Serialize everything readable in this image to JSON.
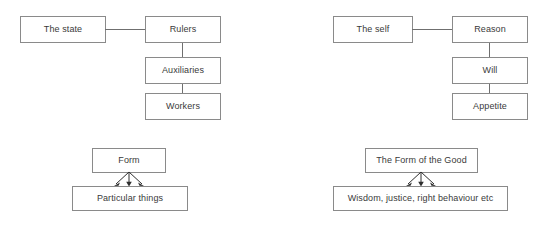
{
  "diagram": {
    "background_color": "#ffffff",
    "box_border_color": "#8a8a8a",
    "line_color": "#6f6f6f",
    "arrow_color": "#2e2e2e",
    "text_color": "#3a3a3a",
    "groups": [
      {
        "id": "state-hierarchy",
        "name": "The state hierarchy",
        "root": "The state",
        "levels": [
          "Rulers",
          "Auxiliaries",
          "Workers"
        ]
      },
      {
        "id": "self-hierarchy",
        "name": "The self hierarchy",
        "root": "The self",
        "levels": [
          "Reason",
          "Will",
          "Appetite"
        ]
      },
      {
        "id": "form-particulars",
        "name": "Form and particulars",
        "source": "Form",
        "target": "Particular things",
        "arrow_count": 3
      },
      {
        "id": "good-virtues",
        "name": "The Form of the Good and virtues",
        "source": "The Form of the Good",
        "target": "Wisdom, justice, right behaviour etc",
        "arrow_count": 3
      }
    ],
    "labels": {
      "the_state": "The state",
      "rulers": "Rulers",
      "auxiliaries": "Auxiliaries",
      "workers": "Workers",
      "the_self": "The self",
      "reason": "Reason",
      "will": "Will",
      "appetite": "Appetite",
      "form": "Form",
      "particular_things": "Particular things",
      "form_of_the_good": "The Form of the Good",
      "virtues": "Wisdom, justice, right behaviour etc"
    }
  }
}
